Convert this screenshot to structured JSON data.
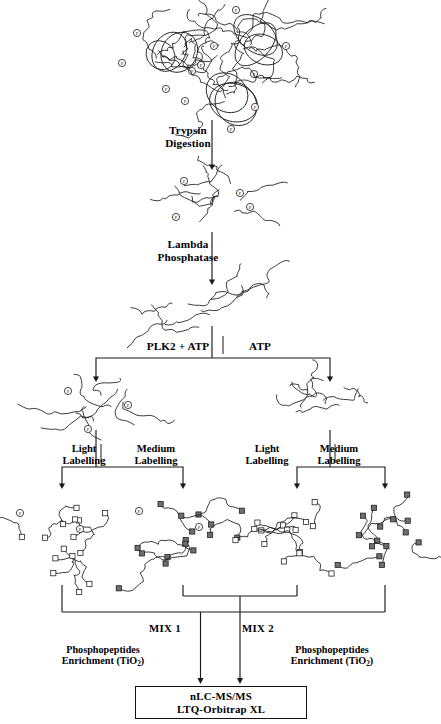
{
  "figure": {
    "icon_names": [
      "phosphate-marker-icon",
      "isotope-label-marker-icon",
      "arrow-down-icon",
      "bracket-split-icon"
    ]
  },
  "steps": {
    "trypsin": {
      "line1": "Trypsin",
      "line2": "Digestion"
    },
    "phosphatase": {
      "line1": "Lambda",
      "line2": "Phosphatase"
    },
    "kinase_left": "PLK2 + ATP",
    "kinase_right": "ATP",
    "label_light": {
      "line1": "Light",
      "line2": "Labelling"
    },
    "label_medium": {
      "line1": "Medium",
      "line2": "Labelling"
    },
    "mix1": "MIX 1",
    "mix2": "MIX 2",
    "enrichment": {
      "line1": "Phosphopeptides",
      "line2_pre": "Enrichment (TiO",
      "line2_sub": "2",
      "line2_post": ")"
    },
    "instrument": {
      "line1": "nLC-MS/MS",
      "line2": "LTQ-Orbitrap XL"
    }
  },
  "colors": {
    "stroke": "#1a1a1a",
    "open_square_fill": "#ffffff",
    "filled_square_fill": "#6e6e6e",
    "text": "#000000"
  },
  "stages": {
    "proteins": {
      "name": "intact-phosphoproteins",
      "count": 3,
      "marker": "phosphate",
      "blobs": [
        {
          "cx": 170,
          "cy": 55,
          "scale": 1.0,
          "rot": 0,
          "phosphates": [
            [
              -33,
              -22
            ],
            [
              -48,
              8
            ],
            [
              -4,
              34
            ],
            [
              22,
              16
            ]
          ]
        },
        {
          "cx": 258,
          "cy": 42,
          "scale": 1.0,
          "rot": 8,
          "phosphates": [
            [
              -22,
              -32
            ],
            [
              -44,
              4
            ],
            [
              -4,
              32
            ],
            [
              28,
              4
            ]
          ]
        },
        {
          "cx": 233,
          "cy": 95,
          "scale": 1.0,
          "rot": -6,
          "phosphates": [
            [
              -32,
              -30
            ],
            [
              -48,
              6
            ],
            [
              -2,
              34
            ],
            [
              22,
              12
            ]
          ]
        }
      ]
    },
    "digested": {
      "name": "digested-phosphopeptides",
      "cx": 212,
      "cy": 203,
      "phosphates": [
        [
          -28,
          -22
        ],
        [
          28,
          -10
        ],
        [
          38,
          4
        ],
        [
          -36,
          14
        ]
      ]
    },
    "dephosphorylated": {
      "name": "dephosphorylated-peptides",
      "cx": 212,
      "cy": 310,
      "phosphates": []
    },
    "kinase_products": [
      {
        "name": "plk2-phosphorylated-peptides",
        "cx": 96,
        "cy": 405,
        "phosphates": [
          [
            -28,
            -14
          ],
          [
            32,
            0
          ],
          [
            -8,
            24
          ]
        ]
      },
      {
        "name": "atp-control-peptides",
        "cx": 330,
        "cy": 405,
        "phosphates": []
      }
    ],
    "labelled_groups": [
      {
        "name": "plk2-light-labelled",
        "cx": 62,
        "cy": 535,
        "marker": "open",
        "branch": "plk2",
        "labelling": "light",
        "mix": "MIX 1",
        "phosphates": [
          [
            -42,
            -22
          ],
          [
            18,
            -6
          ]
        ]
      },
      {
        "name": "plk2-medium-labelled",
        "cx": 183,
        "cy": 535,
        "marker": "filled",
        "branch": "plk2",
        "labelling": "medium",
        "mix": "MIX 2",
        "phosphates": [
          [
            -44,
            -24
          ],
          [
            16,
            -8
          ]
        ]
      },
      {
        "name": "atp-light-labelled",
        "cx": 297,
        "cy": 535,
        "marker": "open",
        "branch": "atp",
        "labelling": "light",
        "mix": "MIX 2",
        "phosphates": []
      },
      {
        "name": "atp-medium-labelled",
        "cx": 385,
        "cy": 535,
        "marker": "filled",
        "branch": "atp",
        "labelling": "medium",
        "mix": "MIX 1",
        "phosphates": []
      }
    ]
  },
  "label_positions": {
    "trypsin": {
      "x": 142,
      "y": 124,
      "w": 92
    },
    "phosphatase": {
      "x": 130,
      "y": 238,
      "w": 116
    },
    "kinase_left": {
      "x": 139,
      "y": 340,
      "w": 78
    },
    "kinase_right": {
      "x": 231,
      "y": 340,
      "w": 58
    },
    "light_left": {
      "x": 56,
      "y": 443,
      "w": 56
    },
    "medium_left": {
      "x": 121,
      "y": 443,
      "w": 70
    },
    "light_right": {
      "x": 239,
      "y": 443,
      "w": 56
    },
    "medium_right": {
      "x": 304,
      "y": 443,
      "w": 70
    },
    "mix1": {
      "x": 135,
      "y": 622,
      "w": 60
    },
    "mix2": {
      "x": 228,
      "y": 622,
      "w": 60
    },
    "enrich_left": {
      "x": 43,
      "y": 644,
      "w": 120
    },
    "enrich_right": {
      "x": 272,
      "y": 644,
      "w": 120
    }
  }
}
